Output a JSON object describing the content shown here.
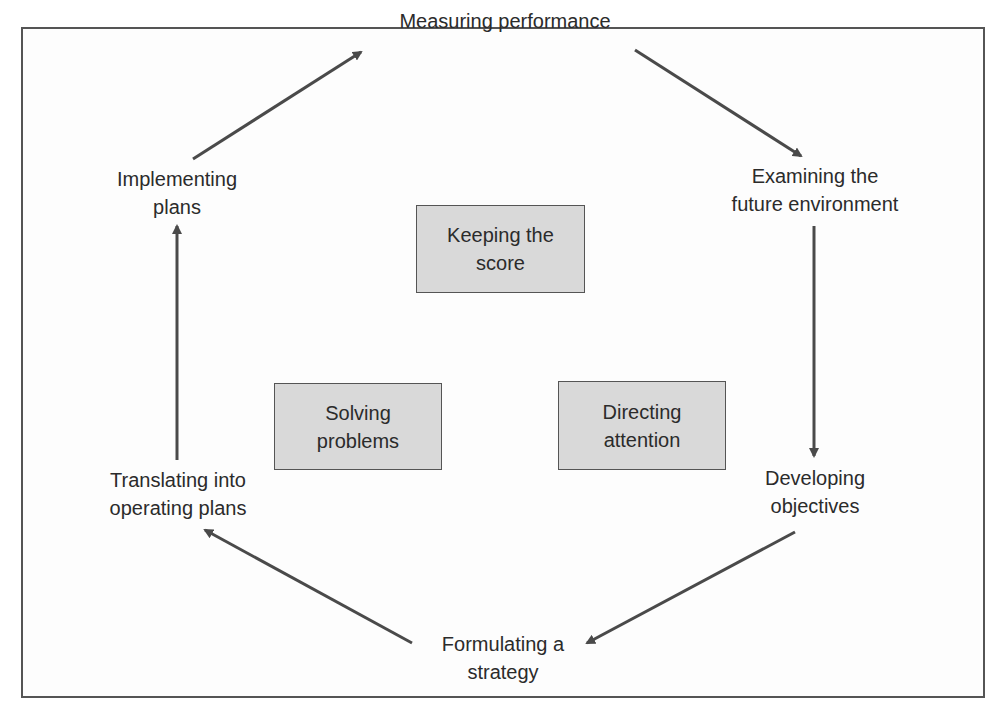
{
  "diagram": {
    "cycle_steps": [
      {
        "id": "measuring",
        "lines": [
          "Measuring performance"
        ]
      },
      {
        "id": "examining",
        "lines": [
          "Examining the",
          "future environment"
        ]
      },
      {
        "id": "developing",
        "lines": [
          "Developing",
          "objectives"
        ]
      },
      {
        "id": "formulating",
        "lines": [
          "Formulating a",
          "strategy"
        ]
      },
      {
        "id": "translating",
        "lines": [
          "Translating into",
          "operating plans"
        ]
      },
      {
        "id": "implementing",
        "lines": [
          "Implementing",
          "plans"
        ]
      }
    ],
    "center_boxes": [
      {
        "id": "keeping-score",
        "lines": [
          "Keeping the",
          "score"
        ]
      },
      {
        "id": "solving-problems",
        "lines": [
          "Solving",
          "problems"
        ]
      },
      {
        "id": "directing-attention",
        "lines": [
          "Directing",
          "attention"
        ]
      }
    ],
    "arrows": [
      {
        "from": "implementing",
        "to": "measuring"
      },
      {
        "from": "measuring",
        "to": "examining"
      },
      {
        "from": "examining",
        "to": "developing"
      },
      {
        "from": "developing",
        "to": "formulating"
      },
      {
        "from": "formulating",
        "to": "translating"
      },
      {
        "from": "translating",
        "to": "implementing"
      }
    ],
    "colors": {
      "box_fill": "#d9d9d9",
      "stroke": "#555555",
      "text": "#2b2b2b"
    }
  }
}
